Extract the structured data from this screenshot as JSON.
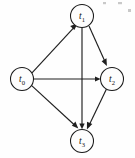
{
  "diagram": {
    "type": "directed-graph",
    "title": "",
    "background_color": "#fefefe",
    "stroke_color": "#1f1f1f",
    "node_fill_color": "#fdfdfd",
    "node_radius": 11.5,
    "nodes": [
      {
        "id": "t0",
        "label_base": "t",
        "label_sub": "0",
        "cx": 22,
        "cy": 79
      },
      {
        "id": "t1",
        "label_base": "t",
        "label_sub": "1",
        "cx": 82,
        "cy": 16
      },
      {
        "id": "t2",
        "label_base": "t",
        "label_sub": "2",
        "cx": 112,
        "cy": 79
      },
      {
        "id": "t3",
        "label_base": "t",
        "label_sub": "3",
        "cx": 82,
        "cy": 141
      }
    ],
    "edges": [
      {
        "id": "e-t0-t1",
        "from": "t0",
        "to": "t1",
        "directed": true
      },
      {
        "id": "e-t0-t2",
        "from": "t0",
        "to": "t2",
        "directed": true
      },
      {
        "id": "e-t0-t3",
        "from": "t0",
        "to": "t3",
        "directed": true
      },
      {
        "id": "e-t1-t2",
        "from": "t1",
        "to": "t2",
        "directed": true
      },
      {
        "id": "e-t1-t3",
        "from": "t1",
        "to": "t3",
        "directed": true
      },
      {
        "id": "e-t2-t3",
        "from": "t2",
        "to": "t3",
        "directed": true
      }
    ]
  }
}
